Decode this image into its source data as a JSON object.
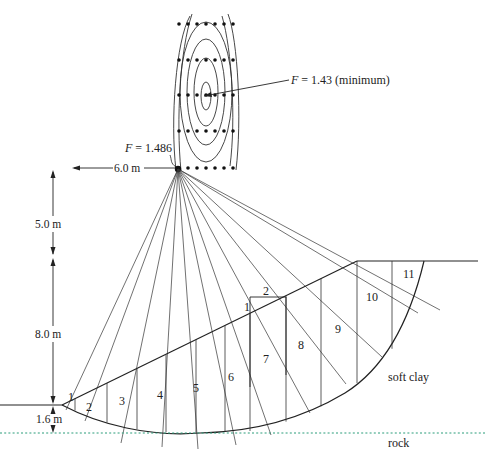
{
  "figure": {
    "type": "slope stability critical circle search diagram",
    "annotations": {
      "min_factor": "F = 1.43 (minimum)",
      "trial_factor": "F = 1.486",
      "min_factor_prefix": "F",
      "min_factor_value": " = 1.43 (minimum)",
      "trial_factor_prefix": "F",
      "trial_factor_value": " = 1.486"
    },
    "dimensions": {
      "horizontal_offset": "6.0 m",
      "height_above_crest": "5.0 m",
      "slope_height": "8.0 m",
      "depth_below_toe": "1.6 m"
    },
    "materials": {
      "upper": "soft clay",
      "lower": "rock"
    },
    "slices": [
      "1",
      "2",
      "3",
      "4",
      "5",
      "6",
      "7",
      "8",
      "9",
      "10",
      "11"
    ],
    "inset_slice": {
      "labels": [
        "1",
        "2"
      ]
    },
    "search_grid": {
      "columns": 7,
      "rows": 5
    },
    "colors": {
      "line": "#222222",
      "rock_line": "#2a9d7a",
      "background": "#ffffff"
    }
  }
}
